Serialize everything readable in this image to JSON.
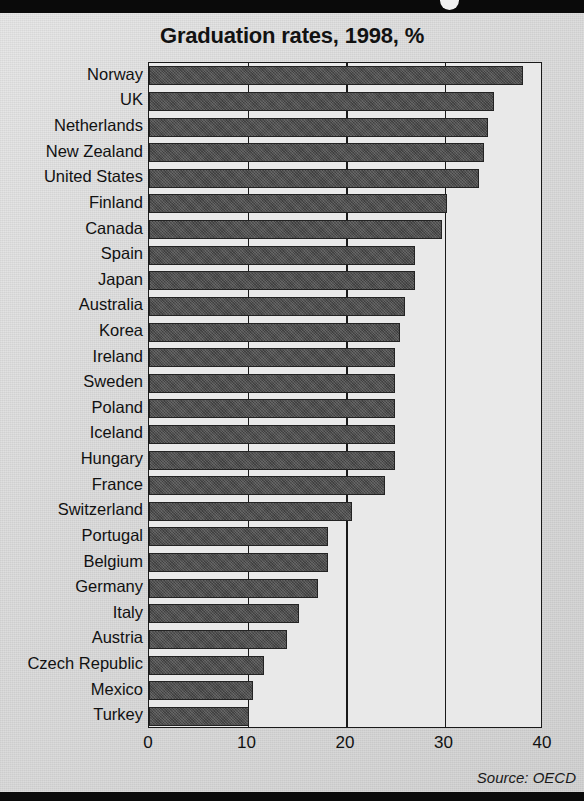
{
  "chart_data": {
    "type": "bar",
    "orientation": "horizontal",
    "title": "Graduation rates, 1998, %",
    "xlabel": "",
    "ylabel": "",
    "xlim": [
      0,
      40
    ],
    "xticks": [
      0,
      10,
      20,
      30,
      40
    ],
    "xtick_labels": [
      "0",
      "10",
      "20",
      "30",
      "40"
    ],
    "grid": true,
    "legend": false,
    "source": "Source: OECD",
    "categories": [
      "Norway",
      "UK",
      "Netherlands",
      "New Zealand",
      "United States",
      "Finland",
      "Canada",
      "Spain",
      "Japan",
      "Australia",
      "Korea",
      "Ireland",
      "Sweden",
      "Poland",
      "Iceland",
      "Hungary",
      "France",
      "Switzerland",
      "Portugal",
      "Belgium",
      "Germany",
      "Italy",
      "Austria",
      "Czech Republic",
      "Mexico",
      "Turkey"
    ],
    "values": [
      38.0,
      35.0,
      34.4,
      34.0,
      33.5,
      30.3,
      29.7,
      27.0,
      27.0,
      26.0,
      25.5,
      25.0,
      25.0,
      25.0,
      25.0,
      25.0,
      24.0,
      20.6,
      18.2,
      18.2,
      17.2,
      15.2,
      14.0,
      11.7,
      10.6,
      10.2
    ]
  },
  "colors": {
    "bar": "#4b4b4b",
    "bar_border": "#232323",
    "plot_background": "#e9e9e9",
    "axis": "#1a1a1a",
    "page_background": "#dcdcdc",
    "band": "#0a0a0a",
    "text": "#111111"
  },
  "decor": {
    "top_band_dot": "circle-marker"
  }
}
